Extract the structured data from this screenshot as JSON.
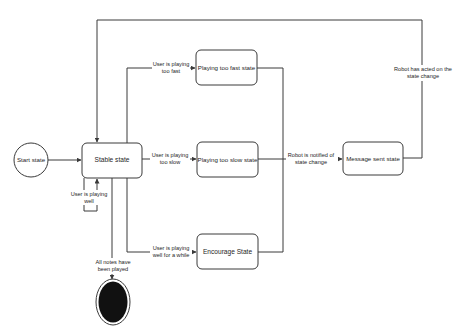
{
  "diagram": {
    "type": "state-machine",
    "colors": {
      "line": "#3a3a3a",
      "node_fill": "#ffffff",
      "end_state_fill": "#111111",
      "text": "#1e1e1e",
      "background": "#ffffff"
    },
    "nodes": {
      "start": {
        "label": "Start state",
        "shape": "circle"
      },
      "stable": {
        "label": "Stable state",
        "shape": "rounded-rect"
      },
      "too_fast": {
        "label": "Playing too fast state",
        "shape": "rounded-rect"
      },
      "too_slow": {
        "label": "Playing too slow state",
        "shape": "rounded-rect"
      },
      "encourage": {
        "label": "Encourage State",
        "shape": "rounded-rect"
      },
      "message_sent": {
        "label": "Message sent state",
        "shape": "rounded-rect"
      },
      "end": {
        "label": "",
        "shape": "filled-circle"
      }
    },
    "edges": {
      "start_to_stable": {
        "from": "Start state",
        "to": "Stable state",
        "label": ""
      },
      "self_loop": {
        "from": "Stable state",
        "to": "Stable state",
        "line1": "User is playing",
        "line2": "well"
      },
      "to_fast": {
        "from": "Stable state",
        "to": "Playing too fast state",
        "line1": "User is playing",
        "line2": "too fast"
      },
      "to_slow": {
        "from": "Stable state",
        "to": "Playing too slow state",
        "line1": "User is playing",
        "line2": "too slow"
      },
      "to_encourage": {
        "from": "Stable state",
        "to": "Encourage State",
        "line1": "User is playing",
        "line2": "well for a while"
      },
      "to_message": {
        "from": "Playing too fast / too slow / Encourage State",
        "to": "Message sent state",
        "line1": "Robot is notified of",
        "line2": "state change"
      },
      "back_to_stable": {
        "from": "Message sent state",
        "to": "Stable state",
        "line1": "Robot has acted on the",
        "line2": "state change"
      },
      "to_end": {
        "from": "Stable state",
        "to": "End",
        "line1": "All notes have",
        "line2": "been played"
      }
    }
  }
}
